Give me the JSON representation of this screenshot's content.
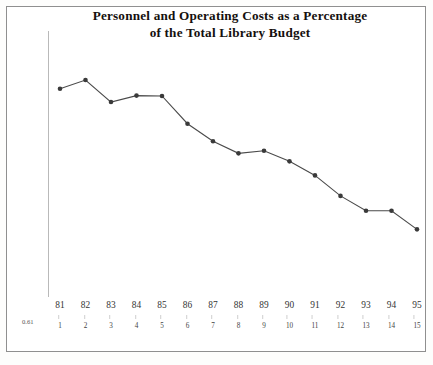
{
  "chart_data": {
    "type": "line",
    "title": "Personnel and Operating Costs as a Percentage of the Total Library Budget",
    "title_line1": "Personnel and Operating Costs as a Percentage",
    "title_line2": "of the Total Library Budget",
    "xlabel": "",
    "ylabel": "",
    "ylim": [
      61.0,
      68.0
    ],
    "ytick_step": 1.0,
    "yticks": [
      "68.00%",
      "67.00%",
      "66.00%",
      "65.00%",
      "64.00%",
      "63.00%",
      "62.00%",
      "61.00%"
    ],
    "ytick_values": [
      68.0,
      67.0,
      66.0,
      65.0,
      64.0,
      63.0,
      62.0,
      61.0
    ],
    "categories": [
      "81",
      "82",
      "83",
      "84",
      "85",
      "86",
      "87",
      "88",
      "89",
      "90",
      "91",
      "92",
      "93",
      "94",
      "95"
    ],
    "secondary_categories": [
      "1",
      "2",
      "3",
      "4",
      "5",
      "6",
      "7",
      "8",
      "9",
      "10",
      "11",
      "12",
      "13",
      "14",
      "15"
    ],
    "secondary_axis_note": "0.61",
    "values": [
      66.48,
      66.71,
      66.13,
      66.3,
      66.29,
      65.56,
      65.1,
      64.78,
      64.85,
      64.57,
      64.2,
      63.66,
      63.27,
      63.27,
      62.78
    ],
    "grid": false,
    "legend": "none",
    "marker": "circle",
    "line_color": "#4a4a4a",
    "marker_color": "#3a3a3a",
    "axis_color": "#b9b9b9",
    "frame_color": "#8f8f8f",
    "background": "#ffffff"
  }
}
